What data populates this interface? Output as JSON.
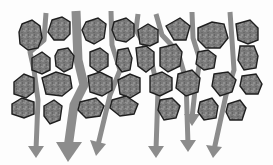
{
  "diagram": {
    "labels": [],
    "colors": {
      "background": "#fdfdfd",
      "particle_fill": "#7a7a7a",
      "particle_outline": "#1e1e1e",
      "flow_arrow": "#8c8c8c"
    },
    "elements": {
      "particles_count": 30,
      "flow_arrows_count": 7,
      "flow_direction": "down"
    }
  }
}
